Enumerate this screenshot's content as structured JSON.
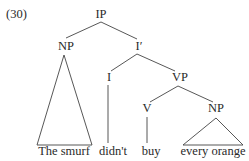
{
  "example_number": "(30)",
  "nodes": {
    "ip": "IP",
    "np_subject": "NP",
    "i_bar": "I′",
    "i": "I",
    "vp": "VP",
    "v": "V",
    "np_object": "NP"
  },
  "leaves": {
    "subject": "The smurf",
    "aux": "didn't",
    "verb": "buy",
    "object": "every orange"
  }
}
